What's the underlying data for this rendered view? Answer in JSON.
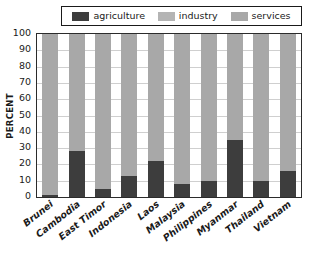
{
  "legend": {
    "entries": [
      {
        "label": "agriculture",
        "color": "#3d3d3d",
        "name": "legend-item-agriculture"
      },
      {
        "label": "industry",
        "color": "#b4b4b4",
        "name": "legend-item-industry"
      },
      {
        "label": "services",
        "color": "#a8a8a8",
        "name": "legend-item-services"
      }
    ]
  },
  "chart_data": {
    "type": "bar",
    "stacked": true,
    "normalized_to_percent": true,
    "title": "",
    "xlabel": "",
    "ylabel": "PERCENT",
    "ylim": [
      0,
      100
    ],
    "ytick_step": 10,
    "yticks": [
      100,
      90,
      80,
      70,
      60,
      50,
      40,
      30,
      20,
      10,
      0
    ],
    "grid": true,
    "grid_axis": "y",
    "legend_position": "top",
    "categories": [
      "Brunei",
      "Cambodia",
      "East Timor",
      "Indonesia",
      "Laos",
      "Malaysia",
      "Philippines",
      "Myanmar",
      "Thailand",
      "Vietnam"
    ],
    "series": [
      {
        "name": "agriculture",
        "color": "#3d3d3d",
        "values": [
          1,
          28,
          5,
          13,
          22,
          8,
          10,
          35,
          10,
          16
        ]
      },
      {
        "name": "industry+services",
        "color": "#a8a8a8",
        "note": "industry and services render as a single gray tone at this resolution",
        "values": [
          99,
          72,
          95,
          87,
          78,
          92,
          90,
          65,
          90,
          84
        ]
      }
    ]
  }
}
